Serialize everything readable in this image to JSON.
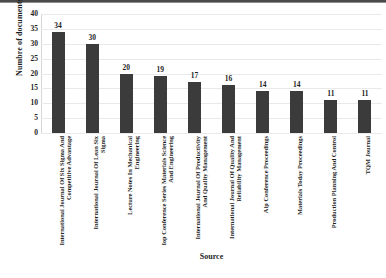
{
  "chart_data": {
    "type": "bar",
    "title": "",
    "xlabel": "Source",
    "ylabel": "Numbre of documents",
    "categories": [
      "International Journal Of Six Sigma And Competitive Advantage",
      "International Journal Of Lean Six Sigma",
      "Lecture Notes In Mechanical Engineering",
      "Iop Conference Series Materials Science And Engineering",
      "International Journal Of Productivity And Quality Management",
      "International Journal Of Quality And Reliability Management",
      "Aip Conference Proceedings",
      "Materials Today Proceedings",
      "Production Planning And Control",
      "TQM Journal"
    ],
    "values": [
      34,
      30,
      20,
      19,
      17,
      16,
      14,
      14,
      11,
      11
    ],
    "ylim": [
      0,
      40
    ],
    "yticks": [
      "0",
      "5",
      "10",
      "15",
      "20",
      "25",
      "30",
      "35",
      "40"
    ],
    "ytick_values": [
      0,
      5,
      10,
      15,
      20,
      25,
      30,
      35,
      40
    ],
    "grid": true,
    "legend": "none",
    "bar_color": "#3b3b3b",
    "grid_color": "#e9e9e9",
    "axis_color": "#bdbdbd",
    "background": "#ffffff"
  }
}
